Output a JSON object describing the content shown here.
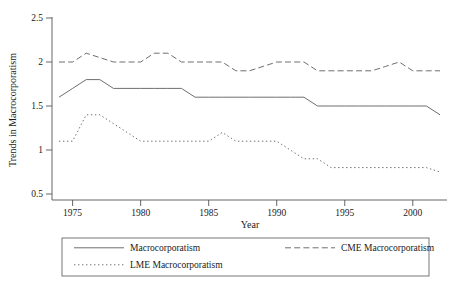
{
  "chart_data": {
    "type": "line",
    "title": "",
    "xlabel": "Year",
    "ylabel": "Trends in Macrocorporatism",
    "xlim": [
      1974,
      2002
    ],
    "ylim": [
      0.5,
      2.5
    ],
    "grid": false,
    "legend_position": "bottom",
    "xticks": [
      1975,
      1980,
      1985,
      1990,
      1995,
      2000
    ],
    "xtick_labels": [
      "1975",
      "1980",
      "1985",
      "1990",
      "1995",
      "2000"
    ],
    "yticks": [
      0.5,
      1,
      1.5,
      2,
      2.5
    ],
    "ytick_labels": [
      "0.5",
      "1",
      "1.5",
      "2",
      "2.5"
    ],
    "x": [
      1974,
      1975,
      1976,
      1977,
      1978,
      1979,
      1980,
      1981,
      1982,
      1983,
      1984,
      1985,
      1986,
      1987,
      1988,
      1989,
      1990,
      1991,
      1992,
      1993,
      1994,
      1995,
      1996,
      1997,
      1998,
      1999,
      2000,
      2001,
      2002
    ],
    "series": [
      {
        "name": "Macrocorporatism",
        "style": "solid",
        "values": [
          1.6,
          1.7,
          1.8,
          1.8,
          1.7,
          1.7,
          1.7,
          1.7,
          1.7,
          1.7,
          1.6,
          1.6,
          1.6,
          1.6,
          1.6,
          1.6,
          1.6,
          1.6,
          1.6,
          1.5,
          1.5,
          1.5,
          1.5,
          1.5,
          1.5,
          1.5,
          1.5,
          1.5,
          1.4
        ]
      },
      {
        "name": "CME Macrocorporatism",
        "style": "dashed",
        "values": [
          2.0,
          2.0,
          2.1,
          2.05,
          2.0,
          2.0,
          2.0,
          2.1,
          2.1,
          2.0,
          2.0,
          2.0,
          2.0,
          1.9,
          1.9,
          1.95,
          2.0,
          2.0,
          2.0,
          1.9,
          1.9,
          1.9,
          1.9,
          1.9,
          1.95,
          2.0,
          1.9,
          1.9,
          1.9
        ]
      },
      {
        "name": "LME Macrocorporatism",
        "style": "dotted",
        "values": [
          1.1,
          1.1,
          1.4,
          1.4,
          1.3,
          1.2,
          1.1,
          1.1,
          1.1,
          1.1,
          1.1,
          1.1,
          1.2,
          1.1,
          1.1,
          1.1,
          1.1,
          1.0,
          0.9,
          0.9,
          0.8,
          0.8,
          0.8,
          0.8,
          0.8,
          0.8,
          0.8,
          0.8,
          0.75
        ]
      }
    ]
  },
  "legend": {
    "entries": [
      {
        "label": "Macrocorporatism",
        "style": "solid"
      },
      {
        "label": "CME Macrocorporatism",
        "style": "dashed"
      },
      {
        "label": "LME Macrocorporatism",
        "style": "dotted"
      }
    ]
  },
  "colors": {
    "line": "#6e6e6e",
    "axis": "#555555",
    "text": "#1a1a1a",
    "background": "#ffffff"
  }
}
